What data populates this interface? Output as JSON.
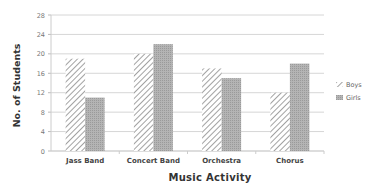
{
  "chart_data": {
    "type": "bar",
    "title": "",
    "xlabel": "Music Activity",
    "ylabel": "No. of Students",
    "categories": [
      "Jass Band",
      "Concert Band",
      "Orchestra",
      "Chorus"
    ],
    "series": [
      {
        "name": "Boys",
        "values": [
          19,
          20,
          17,
          12
        ],
        "pattern": "diagonal-hatch",
        "color": "#8a8a8a"
      },
      {
        "name": "Girls",
        "values": [
          11,
          22,
          15,
          18
        ],
        "pattern": "dotted-fill",
        "color": "#a9a9a9"
      }
    ],
    "ylim": [
      0,
      28
    ],
    "yticks": [
      0,
      4,
      8,
      12,
      16,
      20,
      24,
      28
    ],
    "grid": true,
    "legend_position": "right"
  },
  "labels": {
    "ylabel": "No. of Students",
    "xlabel": "Music Activity",
    "legend_boys": "Boys",
    "legend_girls": "Girls"
  }
}
